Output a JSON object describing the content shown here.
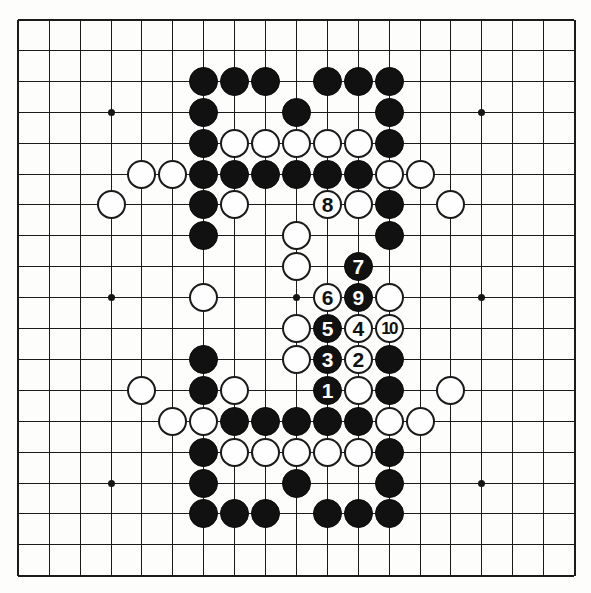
{
  "figure": {
    "kind": "go-board-diagram",
    "board_size": 19,
    "colors": {
      "board_background": "#fdfdfb",
      "line": "#1b1b1b",
      "black_stone": "#111111",
      "white_stone": "#fefefe",
      "black_label_text": "#ffffff",
      "white_label_text": "#111111"
    },
    "geometry": {
      "origin_x": 18.3,
      "origin_y": 19.5,
      "spacing": 30.9,
      "stone_diameter": 29
    },
    "star_points": [
      {
        "col": 4,
        "row": 4
      },
      {
        "col": 10,
        "row": 4
      },
      {
        "col": 16,
        "row": 4
      },
      {
        "col": 4,
        "row": 10
      },
      {
        "col": 10,
        "row": 10
      },
      {
        "col": 16,
        "row": 10
      },
      {
        "col": 4,
        "row": 16
      },
      {
        "col": 10,
        "row": 16
      },
      {
        "col": 16,
        "row": 16
      }
    ]
  },
  "stones": [
    {
      "col": 7,
      "row": 3,
      "color": "black",
      "label": ""
    },
    {
      "col": 8,
      "row": 3,
      "color": "black",
      "label": ""
    },
    {
      "col": 9,
      "row": 3,
      "color": "black",
      "label": ""
    },
    {
      "col": 11,
      "row": 3,
      "color": "black",
      "label": ""
    },
    {
      "col": 12,
      "row": 3,
      "color": "black",
      "label": ""
    },
    {
      "col": 13,
      "row": 3,
      "color": "black",
      "label": ""
    },
    {
      "col": 7,
      "row": 4,
      "color": "black",
      "label": ""
    },
    {
      "col": 10,
      "row": 4,
      "color": "black",
      "label": ""
    },
    {
      "col": 13,
      "row": 4,
      "color": "black",
      "label": ""
    },
    {
      "col": 7,
      "row": 5,
      "color": "black",
      "label": ""
    },
    {
      "col": 8,
      "row": 5,
      "color": "white",
      "label": ""
    },
    {
      "col": 9,
      "row": 5,
      "color": "white",
      "label": ""
    },
    {
      "col": 10,
      "row": 5,
      "color": "white",
      "label": ""
    },
    {
      "col": 11,
      "row": 5,
      "color": "white",
      "label": ""
    },
    {
      "col": 12,
      "row": 5,
      "color": "white",
      "label": ""
    },
    {
      "col": 13,
      "row": 5,
      "color": "black",
      "label": ""
    },
    {
      "col": 5,
      "row": 6,
      "color": "white",
      "label": ""
    },
    {
      "col": 6,
      "row": 6,
      "color": "white",
      "label": ""
    },
    {
      "col": 7,
      "row": 6,
      "color": "black",
      "label": ""
    },
    {
      "col": 8,
      "row": 6,
      "color": "black",
      "label": ""
    },
    {
      "col": 9,
      "row": 6,
      "color": "black",
      "label": ""
    },
    {
      "col": 10,
      "row": 6,
      "color": "black",
      "label": ""
    },
    {
      "col": 11,
      "row": 6,
      "color": "black",
      "label": ""
    },
    {
      "col": 12,
      "row": 6,
      "color": "black",
      "label": ""
    },
    {
      "col": 13,
      "row": 6,
      "color": "white",
      "label": ""
    },
    {
      "col": 14,
      "row": 6,
      "color": "white",
      "label": ""
    },
    {
      "col": 4,
      "row": 7,
      "color": "white",
      "label": ""
    },
    {
      "col": 7,
      "row": 7,
      "color": "black",
      "label": ""
    },
    {
      "col": 8,
      "row": 7,
      "color": "white",
      "label": ""
    },
    {
      "col": 11,
      "row": 7,
      "color": "white",
      "label": "8"
    },
    {
      "col": 12,
      "row": 7,
      "color": "white",
      "label": ""
    },
    {
      "col": 13,
      "row": 7,
      "color": "black",
      "label": ""
    },
    {
      "col": 15,
      "row": 7,
      "color": "white",
      "label": ""
    },
    {
      "col": 7,
      "row": 8,
      "color": "black",
      "label": ""
    },
    {
      "col": 10,
      "row": 8,
      "color": "white",
      "label": ""
    },
    {
      "col": 13,
      "row": 8,
      "color": "black",
      "label": ""
    },
    {
      "col": 10,
      "row": 9,
      "color": "white",
      "label": ""
    },
    {
      "col": 12,
      "row": 9,
      "color": "black",
      "label": "7"
    },
    {
      "col": 7,
      "row": 10,
      "color": "white",
      "label": ""
    },
    {
      "col": 11,
      "row": 10,
      "color": "white",
      "label": "6"
    },
    {
      "col": 12,
      "row": 10,
      "color": "black",
      "label": "9"
    },
    {
      "col": 13,
      "row": 10,
      "color": "white",
      "label": ""
    },
    {
      "col": 10,
      "row": 11,
      "color": "white",
      "label": ""
    },
    {
      "col": 11,
      "row": 11,
      "color": "black",
      "label": "5"
    },
    {
      "col": 12,
      "row": 11,
      "color": "white",
      "label": "4"
    },
    {
      "col": 13,
      "row": 11,
      "color": "white",
      "label": "10"
    },
    {
      "col": 7,
      "row": 12,
      "color": "black",
      "label": ""
    },
    {
      "col": 10,
      "row": 12,
      "color": "white",
      "label": ""
    },
    {
      "col": 11,
      "row": 12,
      "color": "black",
      "label": "3"
    },
    {
      "col": 12,
      "row": 12,
      "color": "white",
      "label": "2"
    },
    {
      "col": 13,
      "row": 12,
      "color": "black",
      "label": ""
    },
    {
      "col": 5,
      "row": 13,
      "color": "white",
      "label": ""
    },
    {
      "col": 7,
      "row": 13,
      "color": "black",
      "label": ""
    },
    {
      "col": 8,
      "row": 13,
      "color": "white",
      "label": ""
    },
    {
      "col": 11,
      "row": 13,
      "color": "black",
      "label": "1"
    },
    {
      "col": 12,
      "row": 13,
      "color": "white",
      "label": ""
    },
    {
      "col": 13,
      "row": 13,
      "color": "black",
      "label": ""
    },
    {
      "col": 15,
      "row": 13,
      "color": "white",
      "label": ""
    },
    {
      "col": 6,
      "row": 14,
      "color": "white",
      "label": ""
    },
    {
      "col": 7,
      "row": 14,
      "color": "white",
      "label": ""
    },
    {
      "col": 8,
      "row": 14,
      "color": "black",
      "label": ""
    },
    {
      "col": 9,
      "row": 14,
      "color": "black",
      "label": ""
    },
    {
      "col": 10,
      "row": 14,
      "color": "black",
      "label": ""
    },
    {
      "col": 11,
      "row": 14,
      "color": "black",
      "label": ""
    },
    {
      "col": 12,
      "row": 14,
      "color": "black",
      "label": ""
    },
    {
      "col": 13,
      "row": 14,
      "color": "white",
      "label": ""
    },
    {
      "col": 14,
      "row": 14,
      "color": "white",
      "label": ""
    },
    {
      "col": 7,
      "row": 15,
      "color": "black",
      "label": ""
    },
    {
      "col": 8,
      "row": 15,
      "color": "white",
      "label": ""
    },
    {
      "col": 9,
      "row": 15,
      "color": "white",
      "label": ""
    },
    {
      "col": 10,
      "row": 15,
      "color": "white",
      "label": ""
    },
    {
      "col": 11,
      "row": 15,
      "color": "white",
      "label": ""
    },
    {
      "col": 12,
      "row": 15,
      "color": "white",
      "label": ""
    },
    {
      "col": 13,
      "row": 15,
      "color": "black",
      "label": ""
    },
    {
      "col": 7,
      "row": 16,
      "color": "black",
      "label": ""
    },
    {
      "col": 10,
      "row": 16,
      "color": "black",
      "label": ""
    },
    {
      "col": 13,
      "row": 16,
      "color": "black",
      "label": ""
    },
    {
      "col": 7,
      "row": 17,
      "color": "black",
      "label": ""
    },
    {
      "col": 8,
      "row": 17,
      "color": "black",
      "label": ""
    },
    {
      "col": 9,
      "row": 17,
      "color": "black",
      "label": ""
    },
    {
      "col": 11,
      "row": 17,
      "color": "black",
      "label": ""
    },
    {
      "col": 12,
      "row": 17,
      "color": "black",
      "label": ""
    },
    {
      "col": 13,
      "row": 17,
      "color": "black",
      "label": ""
    }
  ],
  "move_sequence": [
    {
      "number": "1",
      "color": "black",
      "col": 11,
      "row": 13
    },
    {
      "number": "2",
      "color": "white",
      "col": 12,
      "row": 12
    },
    {
      "number": "3",
      "color": "black",
      "col": 11,
      "row": 12
    },
    {
      "number": "4",
      "color": "white",
      "col": 12,
      "row": 11
    },
    {
      "number": "5",
      "color": "black",
      "col": 11,
      "row": 11
    },
    {
      "number": "6",
      "color": "white",
      "col": 11,
      "row": 10
    },
    {
      "number": "7",
      "color": "black",
      "col": 12,
      "row": 9
    },
    {
      "number": "8",
      "color": "white",
      "col": 11,
      "row": 7
    },
    {
      "number": "9",
      "color": "black",
      "col": 12,
      "row": 10
    },
    {
      "number": "10",
      "color": "white",
      "col": 13,
      "row": 11
    }
  ]
}
